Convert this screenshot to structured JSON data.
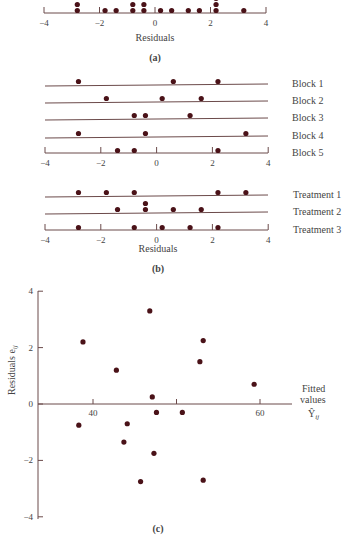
{
  "colors": {
    "dot": "#4a1218",
    "line": "#6b4a4a",
    "text": "#444444"
  },
  "chart_data": [
    {
      "id": "a",
      "type": "scatter",
      "title": "",
      "caption": "(a)",
      "xlabel": "Residuals",
      "xlim": [
        -4,
        4
      ],
      "xticks": [
        -4,
        -2,
        0,
        2,
        4
      ],
      "xtick_labels": [
        "−4",
        "−2",
        "0",
        "2",
        "4"
      ],
      "values": [
        -2.8,
        -2.8,
        -1.8,
        -1.4,
        -0.8,
        -0.8,
        -0.4,
        -0.4,
        0.2,
        0.6,
        1.2,
        1.6,
        2.2,
        2.2,
        2.2,
        3.2
      ]
    },
    {
      "id": "b",
      "type": "scatter",
      "caption": "(b)",
      "xlabel": "Residuals",
      "xlim": [
        -4,
        4
      ],
      "xticks": [
        -4,
        -2,
        0,
        2,
        4
      ],
      "xtick_labels": [
        "−4",
        "−2",
        "0",
        "2",
        "4"
      ],
      "series": [
        {
          "name": "Block 1",
          "values": [
            -2.8,
            0.6,
            2.2
          ]
        },
        {
          "name": "Block 2",
          "values": [
            -1.8,
            0.2,
            1.6
          ]
        },
        {
          "name": "Block 3",
          "values": [
            -0.8,
            -0.4,
            1.2
          ]
        },
        {
          "name": "Block 4",
          "values": [
            -2.8,
            -0.4,
            3.2
          ]
        },
        {
          "name": "Block 5",
          "values": [
            -1.4,
            -0.8,
            2.2
          ]
        },
        {
          "name": "Treatment 1",
          "values": [
            -2.8,
            -1.8,
            -0.8,
            2.2,
            3.2
          ]
        },
        {
          "name": "Treatment 2",
          "values": [
            -1.4,
            -0.4,
            -0.4,
            0.6,
            1.6
          ]
        },
        {
          "name": "Treatment 3",
          "values": [
            -2.8,
            -0.8,
            0.2,
            1.2,
            2.2
          ]
        }
      ]
    },
    {
      "id": "c",
      "type": "scatter",
      "caption": "(c)",
      "xlabel": "Fitted values Ŷij",
      "ylabel": "Residuals eij",
      "xlim": [
        33.5,
        67
      ],
      "ylim": [
        -4,
        4
      ],
      "xticks": [
        40,
        50,
        60
      ],
      "xtick_labels": [
        "40",
        "",
        "60"
      ],
      "yticks": [
        -4,
        -2,
        0,
        2,
        4
      ],
      "ytick_labels": [
        "−4",
        "−2",
        "0",
        "2",
        "4"
      ],
      "points": [
        {
          "x": 38.8,
          "y": 2.2
        },
        {
          "x": 42.8,
          "y": 1.2
        },
        {
          "x": 46.8,
          "y": 3.3
        },
        {
          "x": 47.1,
          "y": 0.25
        },
        {
          "x": 52.8,
          "y": 1.5
        },
        {
          "x": 53.2,
          "y": 2.25
        },
        {
          "x": 59.3,
          "y": 0.7
        },
        {
          "x": 38.3,
          "y": -0.75
        },
        {
          "x": 44.1,
          "y": -0.7
        },
        {
          "x": 43.7,
          "y": -1.35
        },
        {
          "x": 47.6,
          "y": -0.3
        },
        {
          "x": 50.7,
          "y": -0.3
        },
        {
          "x": 47.3,
          "y": -1.75
        },
        {
          "x": 45.7,
          "y": -2.75
        },
        {
          "x": 53.2,
          "y": -2.7
        }
      ]
    }
  ],
  "labels": {
    "a_xlabel": "Residuals",
    "a_caption": "(a)",
    "b_xlabel": "Residuals",
    "b_caption": "(b)",
    "c_caption": "(c)",
    "c_ylabel_main": "Residuals e",
    "c_ylabel_sub": "ij",
    "c_xlabel_line1": "Fitted",
    "c_xlabel_line2": "values",
    "c_xlabel_sym": "Ŷ",
    "c_xlabel_sub": "ij",
    "ticks_res": [
      "−4",
      "−2",
      "0",
      "2",
      "4"
    ],
    "ticks_c_x": [
      "40",
      "60"
    ],
    "ticks_c_y": [
      "4",
      "2",
      "0",
      "−2",
      "−4"
    ],
    "blocks": [
      "Block 1",
      "Block 2",
      "Block 3",
      "Block 4",
      "Block 5"
    ],
    "treatments": [
      "Treatment 1",
      "Treatment 2",
      "Treatment 3"
    ]
  }
}
